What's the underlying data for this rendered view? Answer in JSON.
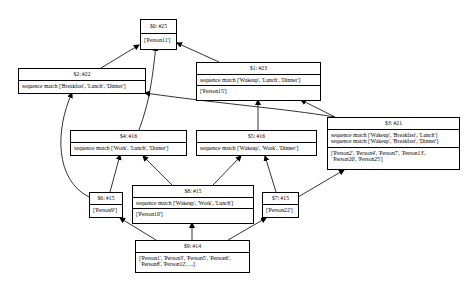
{
  "diagram": {
    "type": "directed-graph",
    "nodes": [
      {
        "id": "0",
        "title": "$0: #25",
        "rules": [],
        "members": "['Person11']"
      },
      {
        "id": "1",
        "title": "$1: #23",
        "rules": [
          "sequence match ['Wakeup', 'Lunch', 'Dinner']"
        ],
        "members": "['Person15']"
      },
      {
        "id": "2",
        "title": "$2: #22",
        "rules": [
          "sequence match ['Breakfast', 'Lunch', 'Dinner']"
        ],
        "members": ""
      },
      {
        "id": "3",
        "title": "$3: #21",
        "rules": [
          "sequence match ['Wakeup', 'Breakfast', 'Lunch']",
          "sequence match ['Wakeup', 'Breakfast', 'Dinner']"
        ],
        "members_line1": "['Person2', 'Person4', 'Person7', 'Person13',",
        "members_line2": " 'Person20', 'Person25']"
      },
      {
        "id": "4",
        "title": "$4: #16",
        "rules": [
          "sequence match ['Work', 'Lunch', 'Dinner']"
        ],
        "members": ""
      },
      {
        "id": "5",
        "title": "$5: #16",
        "rules": [
          "sequence match ['Wakeup', 'Work', 'Dinner']"
        ],
        "members": ""
      },
      {
        "id": "6",
        "title": "$6: #15",
        "rules": [],
        "members": "['Person9']"
      },
      {
        "id": "7",
        "title": "$7: #15",
        "rules": [],
        "members": "['Person22']"
      },
      {
        "id": "8",
        "title": "$8: #15",
        "rules": [
          "sequence match ['Wakeup', 'Work', 'Lunch']"
        ],
        "members": "['Person10']"
      },
      {
        "id": "9",
        "title": "$9: #14",
        "rules": [],
        "members_line1": "['Person1', 'Person3', 'Person5', 'Person6',",
        "members_line2": " 'Person8', 'Person12', ...]"
      }
    ],
    "edges": [
      [
        "2",
        "0"
      ],
      [
        "4",
        "0"
      ],
      [
        "1",
        "0"
      ],
      [
        "3",
        "2"
      ],
      [
        "3",
        "1"
      ],
      [
        "5",
        "1"
      ],
      [
        "6",
        "2"
      ],
      [
        "6",
        "4"
      ],
      [
        "8",
        "4"
      ],
      [
        "8",
        "5"
      ],
      [
        "7",
        "5"
      ],
      [
        "7",
        "3"
      ],
      [
        "9",
        "6"
      ],
      [
        "9",
        "8"
      ],
      [
        "9",
        "7"
      ]
    ]
  }
}
